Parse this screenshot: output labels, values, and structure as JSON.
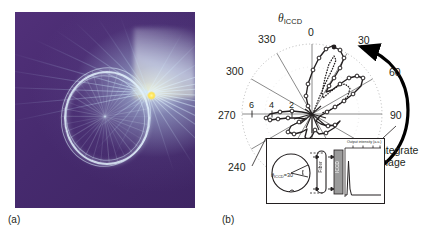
{
  "figure": {
    "panels": [
      {
        "id": "a",
        "label": "(a)",
        "type": "photograph",
        "description": "false-colour image of whispering-gallery / caustic ring with bright emission spot",
        "colors": {
          "background": "#4a2d72",
          "rays": "#d8ecfb",
          "hotspot": "#ffe24f"
        }
      },
      {
        "id": "b",
        "label": "(b)",
        "type": "polar-plot"
      }
    ]
  },
  "polar": {
    "angle_axis_label": "θ",
    "angle_axis_subscript": "ICCD",
    "angle_ticks": [
      "0",
      "30",
      "60",
      "90",
      "240",
      "270",
      "300",
      "330"
    ],
    "angle_tick_values": [
      0,
      30,
      60,
      90,
      240,
      270,
      300,
      330
    ],
    "radial_ticks": [
      "6",
      "4",
      "2"
    ],
    "radial_tick_values": [
      6,
      4,
      2
    ],
    "rmax": 7,
    "annotation": "Integrate\nimage",
    "annotation_line1": "Integrate",
    "annotation_line2": "image",
    "arrow_color": "#000000",
    "grid_color": "#9a9a9a",
    "outer_circle": "dotted"
  },
  "chart_data": {
    "type": "line",
    "title": "",
    "subtype": "polar",
    "xlabel": "θ_ICCD (degrees)",
    "ylabel": "Output intensity (a.u.)",
    "rlim": [
      0,
      7
    ],
    "grid": true,
    "legend_position": "none",
    "series": [
      {
        "name": "measured (open circles, solid line)",
        "marker": "open-circle",
        "linestyle": "solid",
        "theta": [
          0,
          5,
          10,
          14,
          18,
          22,
          26,
          30,
          33,
          36,
          40,
          44,
          48,
          52,
          56,
          60,
          64,
          68,
          72,
          76,
          80,
          85,
          90,
          120,
          150,
          180,
          200,
          210,
          225,
          240,
          255,
          262,
          268,
          272,
          278,
          285,
          300,
          315,
          330,
          345
        ],
        "r": [
          1.6,
          2.5,
          3.4,
          4.2,
          4.8,
          5.2,
          5.5,
          5.9,
          5.1,
          3.6,
          2.6,
          3.0,
          3.9,
          4.6,
          4.9,
          4.7,
          4.1,
          3.3,
          2.6,
          2.0,
          1.5,
          1.0,
          0.5,
          0.4,
          0.35,
          0.3,
          0.45,
          0.6,
          0.7,
          0.9,
          1.2,
          2.0,
          2.6,
          2.7,
          2.4,
          1.3,
          0.6,
          0.5,
          0.7,
          1.0
        ]
      },
      {
        "name": "reference (dotted line)",
        "marker": "none",
        "linestyle": "dotted",
        "theta": [
          2,
          8,
          14,
          20,
          26,
          32,
          38,
          44,
          50,
          56,
          62,
          68,
          74,
          80
        ],
        "r": [
          1.2,
          2.4,
          3.6,
          4.4,
          5.0,
          4.6,
          3.2,
          2.4,
          3.1,
          3.8,
          3.6,
          2.9,
          2.1,
          1.4
        ]
      }
    ]
  },
  "inset": {
    "axis_title": "Output intensity (a.u.)",
    "axis_ticks": [
      "0",
      "1",
      "2"
    ],
    "circle_label_symbol": "θ",
    "circle_label_subscript": "ICCD",
    "circle_label_value": "=30",
    "circle_label_full": "θICCD=30",
    "vertical_labels": [
      "Fiber",
      "ICCD"
    ],
    "fiber_label": "Fiber",
    "iccd_label": "ICCD",
    "iccd_bar_color": "#9a9a9a"
  }
}
